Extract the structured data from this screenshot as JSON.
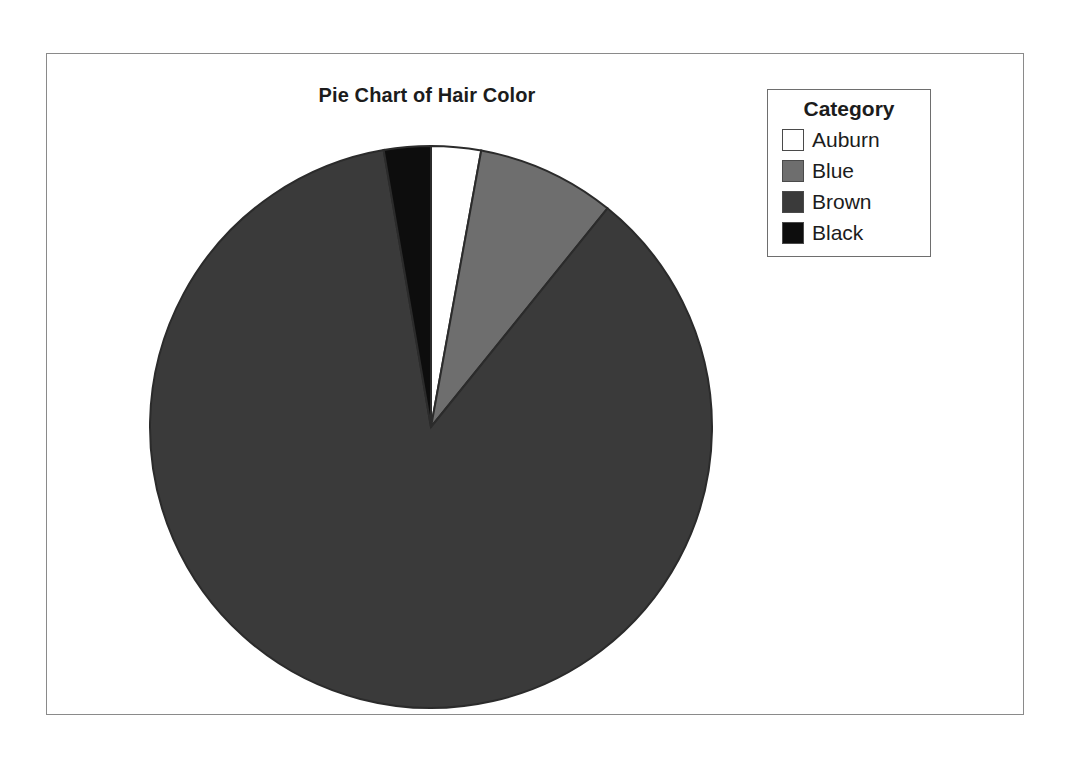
{
  "chart_data": {
    "type": "pie",
    "title": "Pie Chart of Hair Color",
    "categories": [
      "Auburn",
      "Blue",
      "Brown",
      "Black"
    ],
    "values": [
      10.3,
      28.6,
      311.4,
      9.7
    ],
    "value_unit": "degrees of arc",
    "percentages": [
      2.9,
      7.9,
      86.5,
      2.7
    ],
    "colors": [
      "#ffffff",
      "#6e6e6e",
      "#3a3a3a",
      "#0d0d0d"
    ],
    "slice_border_color": "#2b2b2b",
    "start_angle_deg": 0,
    "direction": "clockwise",
    "legend": {
      "title": "Category",
      "position": "top-right",
      "entries": [
        {
          "label": "Auburn",
          "color": "#ffffff"
        },
        {
          "label": "Blue",
          "color": "#6e6e6e"
        },
        {
          "label": "Brown",
          "color": "#3a3a3a"
        },
        {
          "label": "Black",
          "color": "#0d0d0d"
        }
      ]
    },
    "xlabel": "",
    "ylabel": "",
    "grid": false
  },
  "frame": {
    "border_color": "#8a8a8a",
    "background": "#ffffff"
  }
}
